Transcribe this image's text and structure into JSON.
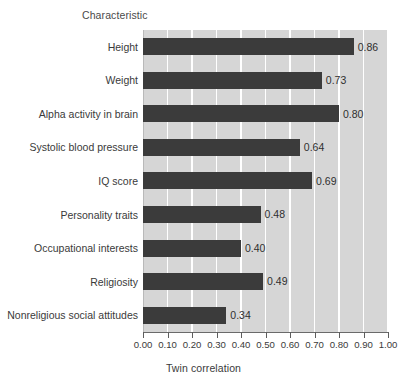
{
  "chart_data": {
    "type": "bar",
    "orientation": "horizontal",
    "title": "",
    "xlabel": "Twin correlation",
    "ylabel": "Characteristic",
    "xlim": [
      0.0,
      1.0
    ],
    "grid": true,
    "legend": null,
    "categories": [
      "Height",
      "Weight",
      "Alpha activity in brain",
      "Systolic blood pressure",
      "IQ score",
      "Personality traits",
      "Occupational interests",
      "Religiosity",
      "Nonreligious social attitudes"
    ],
    "values": [
      0.86,
      0.73,
      0.8,
      0.64,
      0.69,
      0.48,
      0.4,
      0.49,
      0.34
    ],
    "value_labels": [
      "0.86",
      "0.73",
      "0.80",
      "0.64",
      "0.69",
      "0.48",
      "0.40",
      "0.49",
      "0.34"
    ],
    "xticks": [
      0.0,
      0.1,
      0.2,
      0.3,
      0.4,
      0.5,
      0.6,
      0.7,
      0.8,
      0.9,
      1.0
    ],
    "xtick_labels": [
      "0.00",
      "0.10",
      "0.20",
      "0.30",
      "0.40",
      "0.50",
      "0.60",
      "0.70",
      "0.80",
      "0.90",
      "1.00"
    ],
    "colors": {
      "bar": "#3b3b3b",
      "plot_background": "#d6d6d6",
      "gridline": "#ffffff",
      "axis": "#6a6a6a",
      "text": "#3a3a3a",
      "page_background": "#ffffff"
    }
  }
}
